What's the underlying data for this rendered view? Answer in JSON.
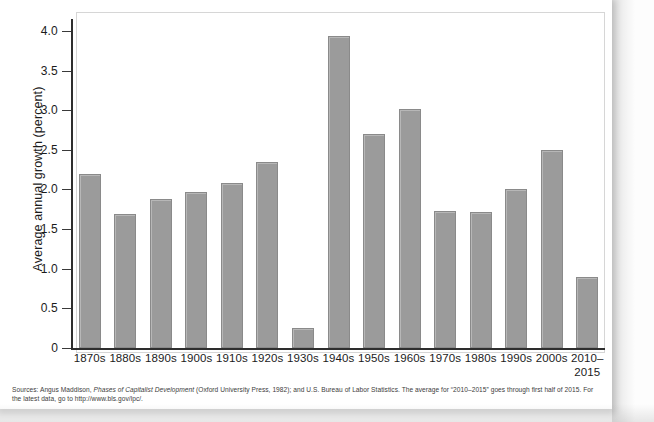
{
  "chart_data": {
    "type": "bar",
    "title": "",
    "xlabel": "",
    "ylabel": "Average annual growth (percent)",
    "categories": [
      "1870s",
      "1880s",
      "1890s",
      "1900s",
      "1910s",
      "1920s",
      "1930s",
      "1940s",
      "1950s",
      "1960s",
      "1970s",
      "1980s",
      "1990s",
      "2000s",
      "2010–2015"
    ],
    "values": [
      2.2,
      1.69,
      1.88,
      1.97,
      2.08,
      2.35,
      0.25,
      3.93,
      2.7,
      3.01,
      1.73,
      1.72,
      2.01,
      2.5,
      0.89
    ],
    "ylim": [
      0,
      4.2
    ],
    "yticks": [
      0,
      0.5,
      1.0,
      1.5,
      2.0,
      2.5,
      3.0,
      3.5,
      4.0
    ],
    "ytick_labels": [
      "0",
      "0.5",
      "1.0",
      "1.5",
      "2.0",
      "2.5",
      "3.0",
      "3.5",
      "4.0"
    ],
    "grid": false,
    "legend": "none",
    "bar_color": "#9b9b9b",
    "bar_border_color": "#8a8a8a",
    "axis_color": "#2e2e2e"
  },
  "x_label_lines": [
    {
      "l1": "1870s",
      "l2": ""
    },
    {
      "l1": "1880s",
      "l2": ""
    },
    {
      "l1": "1890s",
      "l2": ""
    },
    {
      "l1": "1900s",
      "l2": ""
    },
    {
      "l1": "1910s",
      "l2": ""
    },
    {
      "l1": "1920s",
      "l2": ""
    },
    {
      "l1": "1930s",
      "l2": ""
    },
    {
      "l1": "1940s",
      "l2": ""
    },
    {
      "l1": "1950s",
      "l2": ""
    },
    {
      "l1": "1960s",
      "l2": ""
    },
    {
      "l1": "1970s",
      "l2": ""
    },
    {
      "l1": "1980s",
      "l2": ""
    },
    {
      "l1": "1990s",
      "l2": ""
    },
    {
      "l1": "2000s",
      "l2": ""
    },
    {
      "l1": "2010–",
      "l2": "2015"
    }
  ],
  "source": {
    "prefix": "Sources: Angus Maddison, ",
    "italic_title": "Phases of Capitalist Development",
    "suffix": " (Oxford University Press, 1982); and U.S. Bureau of Labor Statistics. The average for “2010–2015” goes through first half of 2015. For the latest data, go to http://www.bls.gov/lpc/."
  }
}
